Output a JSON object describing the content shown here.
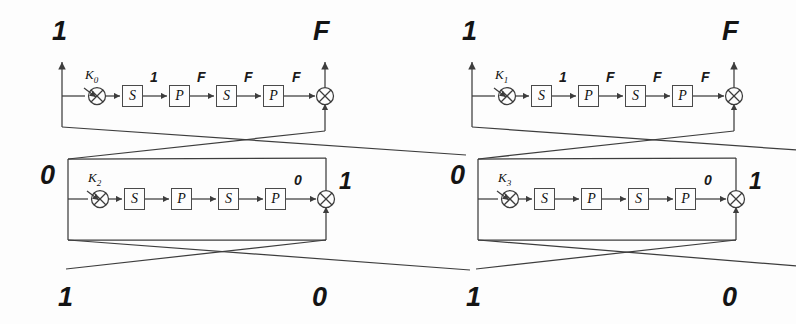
{
  "diagram": {
    "stroke_color": "#3d3d3d",
    "label_color": "#141414",
    "background_color": "#fdfdfd"
  },
  "rounds": [
    {
      "id": "round-0",
      "key_label": "K",
      "key_subscript": "0",
      "stages": [
        "S",
        "P",
        "S",
        "P"
      ],
      "stage_outputs": [
        "1",
        "F",
        "F",
        "F"
      ],
      "input_label": "1",
      "output_label": "F"
    },
    {
      "id": "round-1",
      "key_label": "K",
      "key_subscript": "1",
      "stages": [
        "S",
        "P",
        "S",
        "P"
      ],
      "stage_outputs": [
        "1",
        "F",
        "F",
        "F"
      ],
      "input_label": "1",
      "output_label": "F"
    },
    {
      "id": "round-2",
      "key_label": "K",
      "key_subscript": "2",
      "stages": [
        "S",
        "P",
        "S",
        "P"
      ],
      "stage_outputs": [
        "",
        "",
        "",
        "0"
      ],
      "input_label": "0",
      "output_label": "1"
    },
    {
      "id": "round-3",
      "key_label": "K",
      "key_subscript": "3",
      "stages": [
        "S",
        "P",
        "S",
        "P"
      ],
      "stage_outputs": [
        "",
        "",
        "",
        "0"
      ],
      "input_label": "0",
      "output_label": "1"
    }
  ],
  "corner_labels": {
    "top_left": "1",
    "top_mid_right": "F",
    "top_right_left": "1",
    "top_right": "F",
    "mid_left": "0",
    "mid_center_left": "1",
    "mid_center_right": "0",
    "mid_right": "1",
    "bottom_left": "1",
    "bottom_center_left": "0",
    "bottom_center_right": "1",
    "bottom_right": "0"
  },
  "symbols": {
    "xor": "+",
    "substitution_box": "S",
    "permutation_box": "P"
  }
}
